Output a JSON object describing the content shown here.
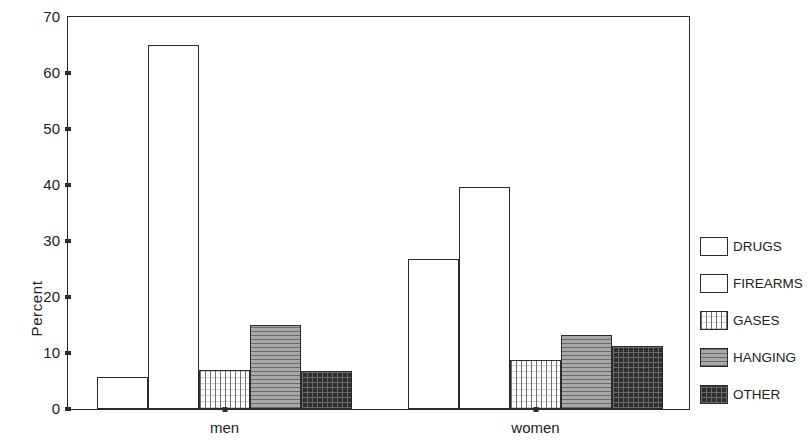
{
  "chart_data": {
    "type": "bar",
    "title": "",
    "subtitle": "",
    "xlabel": "",
    "ylabel": "Percent",
    "ylim": [
      0,
      70
    ],
    "ytick_values": [
      0,
      10,
      20,
      30,
      40,
      50,
      60,
      70
    ],
    "ytick_labels": [
      "0",
      "10",
      "20",
      "30",
      "40",
      "50",
      "60",
      "70"
    ],
    "grid": false,
    "legend_position": "right",
    "categories": [
      "men",
      "women"
    ],
    "series": [
      {
        "name": "DRUGS",
        "values": [
          5.8,
          26.8
        ],
        "fill": "empty",
        "color": "#ffffff"
      },
      {
        "name": "FIREARMS",
        "values": [
          65.0,
          39.6
        ],
        "fill": "empty",
        "color": "#ffffff"
      },
      {
        "name": "GASES",
        "values": [
          7.0,
          8.7
        ],
        "fill": "vlines",
        "color": "#fdfdfd"
      },
      {
        "name": "HANGING",
        "values": [
          15.0,
          13.3
        ],
        "fill": "hlines",
        "color": "#a8a8a8"
      },
      {
        "name": "OTHER",
        "values": [
          6.7,
          11.3
        ],
        "fill": "cross",
        "color": "#2e2e2e"
      }
    ],
    "legend_entries": [
      "DRUGS",
      "FIREARMS",
      "GASES",
      "HANGING",
      "OTHER"
    ]
  },
  "axis": {
    "frame_color": "#2b2b2b",
    "text_color": "#222222"
  }
}
